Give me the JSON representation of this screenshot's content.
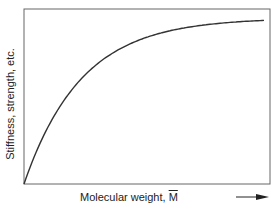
{
  "chart_data": {
    "type": "line",
    "title": "",
    "xlabel": "Molecular weight, M̄",
    "xlabel_prefix": "Molecular weight, ",
    "xlabel_symbol": "M",
    "ylabel": "Stiffness, strength, etc.",
    "grid": false,
    "ticks": false,
    "series": [
      {
        "name": "property",
        "x": [
          0,
          0.05,
          0.1,
          0.2,
          0.3,
          0.4,
          0.5,
          0.6,
          0.7,
          0.8,
          0.9,
          1.0
        ],
        "y": [
          0,
          0.3,
          0.48,
          0.66,
          0.75,
          0.81,
          0.86,
          0.89,
          0.91,
          0.92,
          0.93,
          0.93
        ]
      }
    ],
    "colors": {
      "line": "#333333",
      "axis": "#555555"
    }
  }
}
